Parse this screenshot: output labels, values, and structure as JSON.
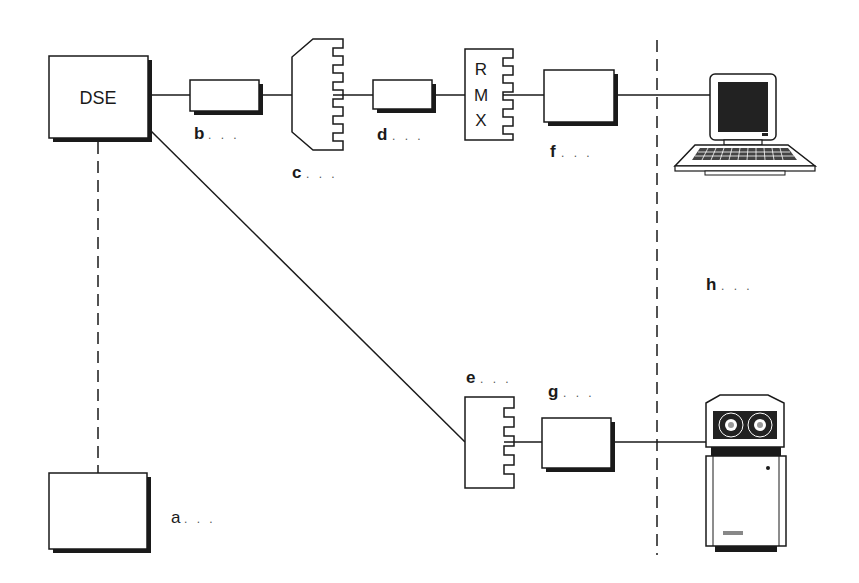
{
  "diagram": {
    "nodes": {
      "dse": {
        "label": "DSE"
      },
      "rmx": {
        "letters": [
          "R",
          "M",
          "X"
        ]
      }
    },
    "labels": {
      "a": {
        "letter": "a",
        "dots": ". . ."
      },
      "b": {
        "letter": "b",
        "dots": ". . ."
      },
      "c": {
        "letter": "c",
        "dots": ". . ."
      },
      "d": {
        "letter": "d",
        "dots": ". . ."
      },
      "e": {
        "letter": "e",
        "dots": ". . ."
      },
      "f": {
        "letter": "f",
        "dots": ". . ."
      },
      "g": {
        "letter": "g",
        "dots": ". . ."
      },
      "h": {
        "letter": "h",
        "dots": ". . ."
      }
    },
    "icons": [
      "computer-terminal-icon",
      "tape-drive-unit-icon"
    ],
    "colors": {
      "line": "#1a1a1a",
      "shadow": "#1a1a1a",
      "screen": "#222222",
      "background": "#ffffff"
    }
  }
}
